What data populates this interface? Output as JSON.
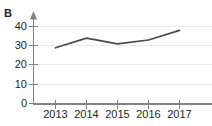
{
  "figure": {
    "panel_label": "B",
    "background_color": "#ffffff"
  },
  "chart_data": {
    "type": "line",
    "title": "",
    "subtitle": "",
    "xlabel": "",
    "ylabel": "",
    "categories": [
      "2013",
      "2014",
      "2015",
      "2016",
      "2017"
    ],
    "series": [
      {
        "name": "B",
        "values": [
          29,
          34,
          31,
          33,
          38
        ],
        "color": "#4a4a4d"
      }
    ],
    "x": [
      2013,
      2014,
      2015,
      2016,
      2017
    ],
    "ylim": [
      0,
      40
    ],
    "ytick_labels": [
      "0",
      "10",
      "20",
      "30",
      "40"
    ],
    "ytick_values": [
      0,
      10,
      20,
      30,
      40
    ],
    "xtick_labels": [
      "2013",
      "2014",
      "2015",
      "2016",
      "2017"
    ],
    "grid": "horizontal",
    "legend": "none",
    "axis_color": "#808285",
    "grid_color": "#e9e9ea",
    "y_axis_arrow": true
  }
}
